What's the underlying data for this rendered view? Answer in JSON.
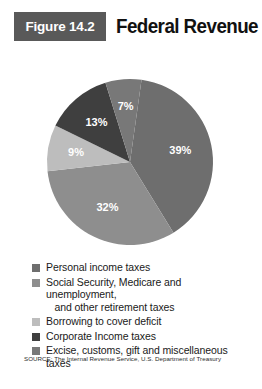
{
  "figure": {
    "badge": "Figure 14.2",
    "title": "Federal Revenue"
  },
  "source": "SOURCE: The Internal Revenue Service, U.S. Department of Treasury",
  "colors": {
    "badge_bg": "#595959",
    "title": "#111111",
    "card_bg": "#ffffff",
    "slice_1": "#6e6e6e",
    "slice_2": "#8e8e8e",
    "slice_3": "#bdbdbd",
    "slice_4": "#3f3f3f",
    "slice_5": "#787878"
  },
  "chart_data": {
    "type": "pie",
    "title": "Federal Revenue",
    "categories": [
      "Personal income taxes",
      "Social Security, Medicare and unemployment, and other retirement taxes",
      "Borrowing to cover deficit",
      "Corporate Income taxes",
      "Excise, customs, gift and miscellaneous taxes"
    ],
    "values": [
      39,
      32,
      9,
      13,
      7
    ],
    "value_labels": [
      "39%",
      "32%",
      "9%",
      "13%",
      "7%"
    ],
    "unit": "percent",
    "legend_position": "bottom",
    "start_angle_deg": 8,
    "direction": "clockwise",
    "slices": [
      {
        "label": "39%",
        "value": 39,
        "color": "#6e6e6e",
        "legend": "Personal income taxes"
      },
      {
        "label": "32%",
        "value": 32,
        "color": "#8e8e8e",
        "legend": "Social Security, Medicare and unemployment, and other retirement taxes"
      },
      {
        "label": "9%",
        "value": 9,
        "color": "#bdbdbd",
        "legend": "Borrowing to cover deficit"
      },
      {
        "label": "13%",
        "value": 13,
        "color": "#3f3f3f",
        "legend": "Corporate Income taxes"
      },
      {
        "label": "7%",
        "value": 7,
        "color": "#787878",
        "legend": "Excise, customs, gift and miscellaneous taxes"
      }
    ]
  },
  "legend": {
    "items": [
      {
        "swatch": "#6e6e6e",
        "line1": "Personal income taxes",
        "line2": ""
      },
      {
        "swatch": "#8e8e8e",
        "line1": "Social Security, Medicare and unemployment,",
        "line2": "and other retirement taxes"
      },
      {
        "swatch": "#bdbdbd",
        "line1": "Borrowing to cover deficit",
        "line2": ""
      },
      {
        "swatch": "#3f3f3f",
        "line1": "Corporate Income taxes",
        "line2": ""
      },
      {
        "swatch": "#787878",
        "line1": "Excise, customs, gift and miscellaneous taxes",
        "line2": ""
      }
    ]
  }
}
